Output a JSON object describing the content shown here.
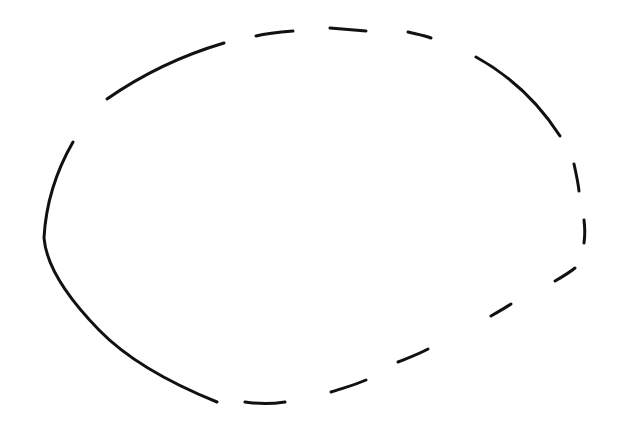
{
  "canvas": {
    "width": 637,
    "height": 433,
    "background": "#ffffff"
  },
  "figure": {
    "shape": "dashed-hand-drawn-ellipse",
    "stroke_color": "#111111",
    "stroke_width": 3,
    "segments": [
      {
        "id": "left-arc",
        "d": "M73,142 C58,168 46,200 44,238 C46,262 62,292 99,330 C130,362 175,385 217,402"
      },
      {
        "id": "top-left-arc",
        "d": "M107,99 C140,76 180,56 224,43"
      },
      {
        "id": "top-dash-1",
        "d": "M256,36 C268,33 280,32 293,31"
      },
      {
        "id": "top-dash-2",
        "d": "M330,28 C342,29 354,30 366,31"
      },
      {
        "id": "top-dash-3",
        "d": "M408,32 C416,34 424,35 431,38"
      },
      {
        "id": "right-arc",
        "d": "M476,57 C505,73 535,97 560,136"
      },
      {
        "id": "right-dash-1",
        "d": "M574,164 C576,173 578,182 579,191"
      },
      {
        "id": "right-dash-2",
        "d": "M584,220 C585,228 585,236 584,243"
      },
      {
        "id": "lower-right-dash-1",
        "d": "M555,281 C562,277 569,273 575,268"
      },
      {
        "id": "lower-right-dash-2",
        "d": "M491,316 C498,312 505,308 511,304"
      },
      {
        "id": "lower-dash-3",
        "d": "M398,362 C408,358 419,354 428,349"
      },
      {
        "id": "lower-dash-4",
        "d": "M331,392 C343,388 355,385 366,380"
      },
      {
        "id": "bottom-dash",
        "d": "M245,402 C258,404 272,404 285,402"
      }
    ]
  }
}
